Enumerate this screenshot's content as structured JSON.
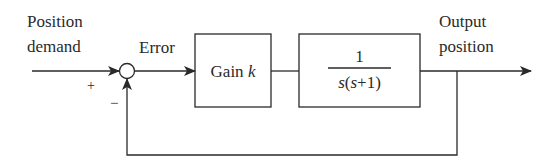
{
  "diagram": {
    "type": "closed-loop control block diagram",
    "input_label": [
      "Position",
      "demand"
    ],
    "error_label": "Error",
    "summing_junction": {
      "plus_sign": "+",
      "minus_sign": "−"
    },
    "blocks": [
      {
        "id": "gain",
        "label_text": "Gain ",
        "label_var": "k"
      },
      {
        "id": "plant",
        "numerator": "1",
        "denominator_var1": "s",
        "denominator_mid": "(",
        "denominator_var2": "s",
        "denominator_tail": "+1)"
      }
    ],
    "output_label": [
      "Output",
      "position"
    ],
    "feedback": "unity negative feedback",
    "colors": {
      "stroke": "#2a2a2a",
      "background": "#ffffff"
    }
  }
}
